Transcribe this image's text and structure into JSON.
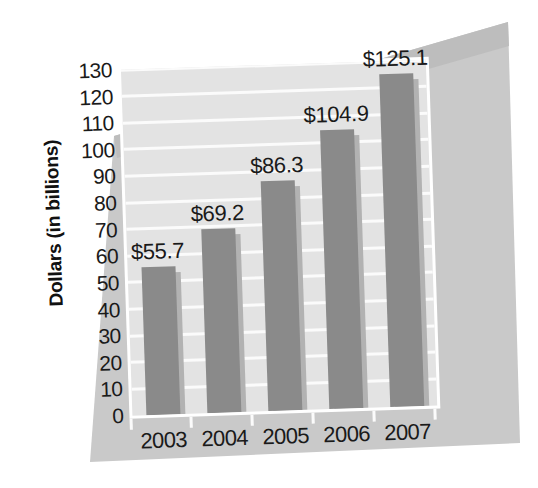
{
  "chart_data": {
    "type": "bar",
    "title": "",
    "subtitle": "",
    "xlabel": "",
    "ylabel": "Dollars (in billions)",
    "categories": [
      "2003",
      "2004",
      "2005",
      "2006",
      "2007"
    ],
    "values": [
      55.7,
      69.2,
      86.3,
      104.9,
      125.1
    ],
    "data_labels": [
      "$55.7",
      "$69.2",
      "$86.3",
      "$104.9",
      "$125.1"
    ],
    "ylim": [
      0,
      130
    ],
    "ytick_step": 10,
    "ytick_labels": [
      "130",
      "120",
      "110",
      "100",
      "90",
      "80",
      "70",
      "60",
      "50",
      "40",
      "30",
      "20",
      "10",
      "0"
    ],
    "grid": true,
    "grid_axis": "y",
    "legend": false,
    "legend_position": "none",
    "colors": {
      "bar": "#8a8a8a",
      "bar_shadow": "#b2b2b2",
      "plot_background": "#e3e3e3",
      "grid_line": "#fbfbfb",
      "plot_border": "#ffffff",
      "panel_background": "#c9c9c9",
      "panel_shade": "#bdbdbd",
      "page_background": "#ffffff",
      "text": "#1a1a1a"
    }
  }
}
